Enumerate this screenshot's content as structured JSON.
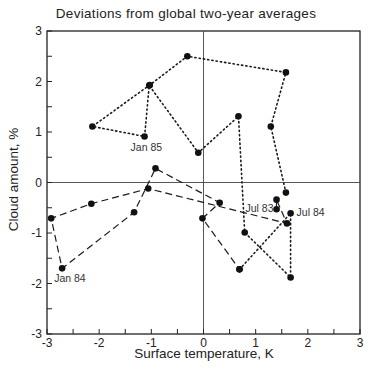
{
  "chart_data": {
    "type": "line",
    "title": "Deviations from global two-year averages",
    "xlabel": "Surface temperature, K",
    "ylabel": "Cloud amount, %",
    "xlim": [
      -3,
      3
    ],
    "ylim": [
      -3,
      3
    ],
    "xticks": [
      -3,
      -2,
      -1,
      0,
      1,
      2,
      3
    ],
    "yticks": [
      -3,
      -2,
      -1,
      0,
      1,
      2,
      3
    ],
    "x_tick_labels": [
      "-3",
      "-2",
      "-1",
      "0",
      "1",
      "2",
      "3"
    ],
    "y_tick_labels": [
      "-3",
      "-2",
      "-1",
      "0",
      "1",
      "2",
      "3"
    ],
    "grid": false,
    "reference_lines": {
      "x": 0,
      "y": 0
    },
    "series": [
      {
        "name": "Jul 83 - Jun 84",
        "style": "dashed",
        "points": [
          {
            "x": 1.4,
            "y": -0.53,
            "label": "Jul 83"
          },
          {
            "x": 1.4,
            "y": -0.34
          },
          {
            "x": 1.6,
            "y": -0.81
          },
          {
            "x": -1.06,
            "y": -0.12
          },
          {
            "x": -2.15,
            "y": -0.42
          },
          {
            "x": -2.92,
            "y": -0.71
          },
          {
            "x": -2.71,
            "y": -1.7,
            "label": "Jan 84"
          },
          {
            "x": -1.33,
            "y": -0.59
          },
          {
            "x": -0.92,
            "y": 0.28
          },
          {
            "x": 0.31,
            "y": -0.4
          },
          {
            "x": -0.02,
            "y": -0.71
          },
          {
            "x": 0.69,
            "y": -1.72
          }
        ]
      },
      {
        "name": "Jul 84 - Jul 85",
        "style": "dotted",
        "points": [
          {
            "x": 0.69,
            "y": -1.72
          },
          {
            "x": 1.67,
            "y": -0.61,
            "label": "Jul 84"
          },
          {
            "x": 1.67,
            "y": -1.88
          },
          {
            "x": 0.79,
            "y": -0.99
          },
          {
            "x": 0.67,
            "y": 1.31
          },
          {
            "x": -0.1,
            "y": 0.59
          },
          {
            "x": -1.04,
            "y": 1.92
          },
          {
            "x": -1.13,
            "y": 0.91,
            "label": "Jan 85"
          },
          {
            "x": -2.13,
            "y": 1.11
          },
          {
            "x": -1.03,
            "y": 1.93
          },
          {
            "x": -0.31,
            "y": 2.5
          },
          {
            "x": 1.58,
            "y": 2.18
          },
          {
            "x": 1.29,
            "y": 1.11
          },
          {
            "x": 1.58,
            "y": -0.2
          }
        ]
      }
    ],
    "annotations": [
      {
        "text": "Jul 83",
        "x": 1.4,
        "y": -0.53,
        "dx": -31,
        "dy": 3
      },
      {
        "text": "Jul 84",
        "x": 1.67,
        "y": -0.61,
        "dx": 6,
        "dy": 3
      },
      {
        "text": "Jan 84",
        "x": -2.71,
        "y": -1.7,
        "dx": -8,
        "dy": 14
      },
      {
        "text": "Jan 85",
        "x": -1.13,
        "y": 0.91,
        "dx": -14,
        "dy": 14
      }
    ]
  }
}
